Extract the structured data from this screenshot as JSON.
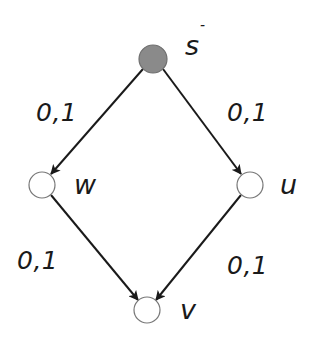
{
  "diagram": {
    "type": "directed-graph",
    "colors": {
      "edge": "#1a1a1a",
      "node_stroke": "#777777",
      "source_fill": "#8a8a8a",
      "node_fill": "#ffffff",
      "text": "#1a1a1a"
    },
    "nodes": [
      {
        "id": "s",
        "label": "s",
        "superscript": "-",
        "x": 153,
        "y": 59,
        "r": 14,
        "filled": true
      },
      {
        "id": "w",
        "label": "w",
        "x": 42,
        "y": 185,
        "r": 13,
        "filled": false
      },
      {
        "id": "u",
        "label": "u",
        "x": 250,
        "y": 185,
        "r": 13,
        "filled": false
      },
      {
        "id": "v",
        "label": "v",
        "x": 147,
        "y": 310,
        "r": 13,
        "filled": false
      }
    ],
    "edges": [
      {
        "from": "s",
        "to": "w",
        "label": "0,1"
      },
      {
        "from": "s",
        "to": "u",
        "label": "0,1"
      },
      {
        "from": "w",
        "to": "v",
        "label": "0,1"
      },
      {
        "from": "u",
        "to": "v",
        "label": "0,1"
      }
    ]
  }
}
